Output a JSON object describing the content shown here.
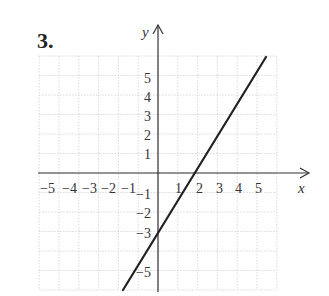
{
  "problem": {
    "number": "3."
  },
  "axes": {
    "x_label": "x",
    "y_label": "y",
    "x_ticks": [
      "−5",
      "−4",
      "−3",
      "−2",
      "−1",
      "1",
      "2",
      "3",
      "4",
      "5"
    ],
    "y_ticks": [
      "5",
      "4",
      "3",
      "2",
      "1",
      "−1",
      "−2",
      "−3",
      "−5"
    ]
  },
  "colors": {
    "line": "#222222",
    "grid": "#c8c8c8",
    "axis": "#333333"
  },
  "chart_data": {
    "type": "line",
    "title": "3.",
    "xlabel": "x",
    "ylabel": "y",
    "xlim": [
      -6,
      6
    ],
    "ylim": [
      -6,
      6
    ],
    "grid": true,
    "series": [
      {
        "name": "y = 2x - 3",
        "x": [
          -1.5,
          4.5
        ],
        "y": [
          -6,
          6
        ]
      }
    ],
    "annotations": {
      "y_intercept": -3,
      "x_intercept": 1.5
    },
    "x_tick_labels": [
      "-5",
      "-4",
      "-3",
      "-2",
      "-1",
      "1",
      "2",
      "3",
      "4",
      "5"
    ],
    "y_tick_labels": [
      "5",
      "4",
      "3",
      "2",
      "1",
      "-1",
      "-2",
      "-3",
      "-5"
    ]
  }
}
